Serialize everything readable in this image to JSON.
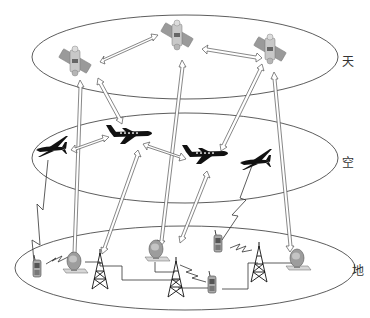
{
  "diagram": {
    "type": "space-air-ground integrated network",
    "layers": [
      {
        "id": "space",
        "label": "天",
        "nodes": [
          "satellite-left",
          "satellite-center",
          "satellite-right"
        ]
      },
      {
        "id": "air",
        "label": "空",
        "nodes": [
          "uav-left",
          "jet-center-left",
          "jet-center-right",
          "uav-right"
        ]
      },
      {
        "id": "ground",
        "label": "地",
        "nodes": [
          "handset-1",
          "ground-station-1",
          "tower-1",
          "ground-station-2",
          "tower-2",
          "handset-2",
          "handset-3",
          "tower-3",
          "ground-station-3"
        ]
      }
    ],
    "links": [
      {
        "from": "satellite-left",
        "to": "satellite-center",
        "style": "double-arrow"
      },
      {
        "from": "satellite-center",
        "to": "satellite-right",
        "style": "double-arrow"
      },
      {
        "from": "satellite-left",
        "to": "jet-center-left",
        "style": "double-arrow"
      },
      {
        "from": "satellite-left",
        "to": "ground-station-1",
        "style": "double-arrow"
      },
      {
        "from": "satellite-center",
        "to": "ground-station-2",
        "style": "double-arrow"
      },
      {
        "from": "satellite-right",
        "to": "jet-center-right",
        "style": "double-arrow"
      },
      {
        "from": "satellite-right",
        "to": "ground-station-3",
        "style": "double-arrow"
      },
      {
        "from": "uav-left",
        "to": "jet-center-left",
        "style": "double-arrow"
      },
      {
        "from": "jet-center-left",
        "to": "jet-center-right",
        "style": "double-arrow"
      },
      {
        "from": "jet-center-left",
        "to": "tower-1",
        "style": "double-arrow"
      },
      {
        "from": "jet-center-right",
        "to": "tower-2",
        "style": "double-arrow"
      },
      {
        "from": "uav-left",
        "to": "handset-1",
        "style": "wireless"
      },
      {
        "from": "uav-right",
        "to": "handset-2",
        "style": "wireless"
      },
      {
        "from": "handset-1",
        "to": "ground-station-1",
        "style": "wireless"
      },
      {
        "from": "handset-2",
        "to": "tower-3",
        "style": "wireless"
      },
      {
        "from": "tower-2",
        "to": "handset-3",
        "style": "wireless"
      },
      {
        "from": "ground-station-1",
        "to": "tower-1",
        "style": "wired"
      },
      {
        "from": "tower-1",
        "to": "tower-2",
        "style": "wired"
      },
      {
        "from": "ground-station-2",
        "to": "tower-2",
        "style": "wired"
      },
      {
        "from": "tower-2",
        "to": "handset-3",
        "style": "wired"
      },
      {
        "from": "handset-3",
        "to": "tower-3",
        "style": "wired"
      },
      {
        "from": "tower-3",
        "to": "ground-station-3",
        "style": "wired"
      }
    ]
  },
  "labels": {
    "space": "天",
    "air": "空",
    "ground": "地"
  }
}
